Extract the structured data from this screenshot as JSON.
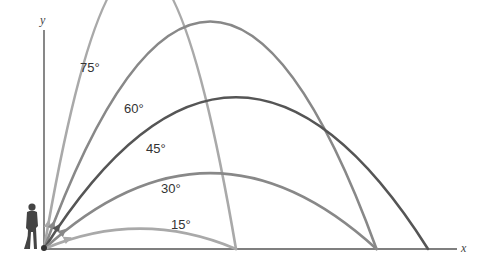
{
  "axes": {
    "x_label": "x",
    "y_label": "y"
  },
  "figure": "golfer-silhouette",
  "trajectories": [
    {
      "angle_label": "75°",
      "angle": 75,
      "color": "#a9a9a9",
      "range_rel": 0.5,
      "peak_rel": 0.933
    },
    {
      "angle_label": "60°",
      "angle": 60,
      "color": "#888888",
      "range_rel": 0.866,
      "peak_rel": 0.75
    },
    {
      "angle_label": "45°",
      "angle": 45,
      "color": "#555555",
      "range_rel": 1.0,
      "peak_rel": 0.5
    },
    {
      "angle_label": "30°",
      "angle": 30,
      "color": "#888888",
      "range_rel": 0.866,
      "peak_rel": 0.25
    },
    {
      "angle_label": "15°",
      "angle": 15,
      "color": "#a9a9a9",
      "range_rel": 0.5,
      "peak_rel": 0.067
    }
  ]
}
